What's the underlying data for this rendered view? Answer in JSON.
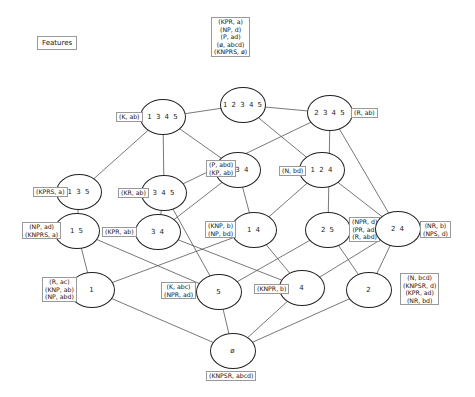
{
  "title": "Features",
  "nodes": [
    {
      "id": "12345",
      "label": "1 2 3 4 5",
      "x": 243,
      "y": 105,
      "attrs": [
        "(KPR, a)",
        "(NP, d)",
        "(P, ad)",
        "(ø, abcd)",
        "(KNPRS, ø)"
      ],
      "lx": 211,
      "ly": 17
    },
    {
      "id": "1345",
      "label": "1 3 4 5",
      "x": 163,
      "y": 117,
      "attrs": [
        "(K, ab)"
      ],
      "lx": 116,
      "ly": 112
    },
    {
      "id": "2345",
      "label": "2 3 4 5",
      "x": 330,
      "y": 113,
      "attrs": [
        "(R, ab)"
      ],
      "lx": 351,
      "ly": 108
    },
    {
      "id": "135",
      "label": "1 3 5",
      "x": 79,
      "y": 192,
      "attrs": [
        "(KPRS, a)"
      ],
      "lx": 33,
      "ly": 187
    },
    {
      "id": "345",
      "label": "3 4 5",
      "x": 164,
      "y": 193,
      "attrs": [
        "(KR, ab)"
      ],
      "lx": 118,
      "ly": 188
    },
    {
      "id": "134",
      "label": "1 3 4",
      "x": 238,
      "y": 170,
      "attrs": [
        "(P, abd)",
        "(KP, ab)"
      ],
      "lx": 206,
      "ly": 160
    },
    {
      "id": "124",
      "label": "1 2 4",
      "x": 322,
      "y": 170,
      "attrs": [
        "(N, bd)"
      ],
      "lx": 279,
      "ly": 166
    },
    {
      "id": "15",
      "label": "1 5",
      "x": 77,
      "y": 231,
      "attrs": [
        "(NP, ad)",
        "(KNPRS, a)"
      ],
      "lx": 22,
      "ly": 222
    },
    {
      "id": "34",
      "label": "3 4",
      "x": 158,
      "y": 232,
      "attrs": [
        "(KPR, ab)"
      ],
      "lx": 102,
      "ly": 227
    },
    {
      "id": "14",
      "label": "1 4",
      "x": 254,
      "y": 230,
      "attrs": [
        "(KNP, b)",
        "(NP, bd)"
      ],
      "lx": 205,
      "ly": 221
    },
    {
      "id": "25",
      "label": "2 5",
      "x": 328,
      "y": 230,
      "attrs": [
        "(NPR, d)",
        "(PR, ad)",
        "(R, abd)"
      ],
      "lx": 349,
      "ly": 217
    },
    {
      "id": "24",
      "label": "2 4",
      "x": 398,
      "y": 229,
      "attrs": [
        "(NR, b)",
        "(NPS, d)"
      ],
      "lx": 420,
      "ly": 221
    },
    {
      "id": "1",
      "label": "1",
      "x": 92,
      "y": 290,
      "attrs": [
        "(R, ac)",
        "(KNP, ab)",
        "(NP, abd)"
      ],
      "lx": 42,
      "ly": 277
    },
    {
      "id": "5",
      "label": "5",
      "x": 219,
      "y": 292,
      "attrs": [
        "(K, abc)",
        "(NPR, ad)"
      ],
      "lx": 161,
      "ly": 282
    },
    {
      "id": "4",
      "label": "4",
      "x": 302,
      "y": 288,
      "attrs": [
        "(KNPR, b)"
      ],
      "lx": 254,
      "ly": 284
    },
    {
      "id": "2",
      "label": "2",
      "x": 369,
      "y": 290,
      "attrs": [
        "(N, bcd)",
        "(KNPSR, d)",
        "(KPR, ad)",
        "(NR, bd)"
      ],
      "lx": 400,
      "ly": 273
    },
    {
      "id": "empty",
      "label": "ø",
      "x": 233,
      "y": 351,
      "attrs": [
        "(KNPSR, abcd)"
      ],
      "lx": 206,
      "ly": 371
    }
  ],
  "edges": [
    [
      "12345",
      "1345"
    ],
    [
      "12345",
      "2345"
    ],
    [
      "12345",
      "124"
    ],
    [
      "1345",
      "135"
    ],
    [
      "1345",
      "345"
    ],
    [
      "1345",
      "134"
    ],
    [
      "2345",
      "345"
    ],
    [
      "2345",
      "25"
    ],
    [
      "2345",
      "24"
    ],
    [
      "135",
      "15"
    ],
    [
      "345",
      "34"
    ],
    [
      "345",
      "5"
    ],
    [
      "134",
      "34"
    ],
    [
      "134",
      "14"
    ],
    [
      "124",
      "14"
    ],
    [
      "124",
      "24"
    ],
    [
      "15",
      "1"
    ],
    [
      "15",
      "5"
    ],
    [
      "34",
      "4"
    ],
    [
      "14",
      "1"
    ],
    [
      "14",
      "4"
    ],
    [
      "25",
      "5"
    ],
    [
      "25",
      "2"
    ],
    [
      "24",
      "4"
    ],
    [
      "24",
      "2"
    ],
    [
      "1",
      "empty"
    ],
    [
      "5",
      "empty"
    ],
    [
      "4",
      "empty"
    ],
    [
      "2",
      "empty"
    ]
  ],
  "node_size": {
    "w": 46,
    "h": 36
  },
  "colors": {
    "stroke": "#222222",
    "edge": "#555555",
    "label_border": "#999999"
  }
}
